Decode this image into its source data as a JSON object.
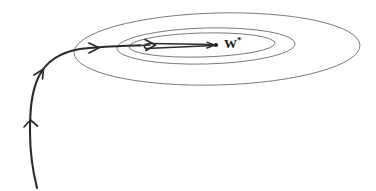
{
  "figure": {
    "background_color": "#ffffff",
    "width": 376,
    "height": 191,
    "contour_color": "#6b6b6b",
    "trajectory_color": "#2b2b2b",
    "label_color": "#1a1a1a"
  },
  "labels": {
    "optimum": "W",
    "optimum_superscript": "*",
    "optimum_full": "W*"
  },
  "chart_data": {
    "type": "diagram",
    "xlabel": "",
    "ylabel": "",
    "grid": false,
    "legend": "none",
    "annotations": [
      {
        "text": "W*",
        "x": 222,
        "y": 45,
        "role": "optimum-label",
        "description": "Label marking the optimal weight vector at the centre of the contours"
      }
    ],
    "contours": [
      {
        "name": "outer-contour",
        "cx": 217,
        "cy": 49,
        "rx": 143,
        "ry": 36,
        "rotation_deg": -1.5
      },
      {
        "name": "middle-contour",
        "cx": 206,
        "cy": 46,
        "rx": 89,
        "ry": 18,
        "rotation_deg": -1.5
      },
      {
        "name": "inner-contour",
        "cx": 202,
        "cy": 45,
        "rx": 73,
        "ry": 12,
        "rotation_deg": -1.5
      }
    ],
    "optimum_point": {
      "x": 216,
      "y": 45
    },
    "trajectory": {
      "description": "Thick descent path entering from lower-left, curving up and right into the contour centre, then zig-zagging along the valley to the optimum",
      "waypoints": [
        {
          "x": 37,
          "y": 188
        },
        {
          "x": 31,
          "y": 150
        },
        {
          "x": 30,
          "y": 120
        },
        {
          "x": 34,
          "y": 92
        },
        {
          "x": 45,
          "y": 67
        },
        {
          "x": 62,
          "y": 53
        },
        {
          "x": 85,
          "y": 48
        },
        {
          "x": 120,
          "y": 46
        },
        {
          "x": 152,
          "y": 45
        },
        {
          "x": 146,
          "y": 47
        },
        {
          "x": 216,
          "y": 45
        }
      ],
      "arrow_markers": [
        {
          "x": 31,
          "y": 122,
          "angle_deg": -86,
          "name": "arrow-1"
        },
        {
          "x": 42,
          "y": 71,
          "angle_deg": -47,
          "name": "arrow-2"
        },
        {
          "x": 97,
          "y": 48,
          "angle_deg": -2,
          "name": "arrow-3"
        },
        {
          "x": 154,
          "y": 45,
          "angle_deg": -3,
          "name": "arrow-4"
        },
        {
          "x": 212,
          "y": 45,
          "angle_deg": 0,
          "name": "arrow-5"
        }
      ]
    }
  }
}
